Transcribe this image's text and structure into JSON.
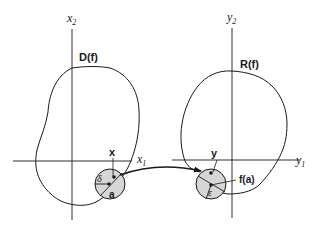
{
  "diagram": {
    "left_panel": {
      "domain_label": "D(f)",
      "x_axis_label": "x",
      "x_axis_sub": "1",
      "y_axis_label": "x",
      "y_axis_sub": "2",
      "point_label": "x",
      "center_label": "a",
      "radius_label": "δ"
    },
    "right_panel": {
      "range_label": "R(f)",
      "x_axis_label": "y",
      "x_axis_sub": "1",
      "y_axis_label": "y",
      "y_axis_sub": "2",
      "point_label": "y",
      "center_label": "f(a)",
      "radius_label": "ε"
    },
    "arrow": "mapping-arrow",
    "colors": {
      "stroke": "#1a1a1a",
      "disk_fill": "#d6d6d6",
      "background": "#ffffff"
    }
  }
}
